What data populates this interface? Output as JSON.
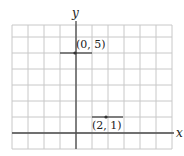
{
  "chart_data": {
    "type": "scatter",
    "title": "",
    "xlabel": "x",
    "ylabel": "y",
    "xlim": [
      -4,
      6
    ],
    "ylim": [
      -1,
      7
    ],
    "grid": true,
    "grid_step": 1,
    "points": [
      {
        "x": 0,
        "y": 5,
        "label": "(0, 5)",
        "segment": [
          -1,
          1
        ]
      },
      {
        "x": 2,
        "y": 1,
        "label": "(2, 1)",
        "segment": [
          1,
          3
        ]
      }
    ]
  },
  "labels": {
    "x_axis": "x",
    "y_axis": "y",
    "point1": "(0, 5)",
    "point2": "(2, 1)"
  },
  "colors": {
    "grid": "#c8c8c8",
    "axis": "#4a4a4a",
    "point": "#333333"
  }
}
